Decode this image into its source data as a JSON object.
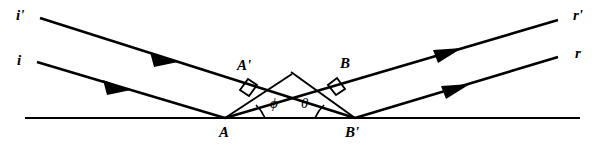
{
  "figure": {
    "background_color": "#ffffff",
    "stroke_color": "#000000"
  },
  "labels": {
    "incident_upper": "i'",
    "incident_lower": "i",
    "reflected_upper": "r'",
    "reflected_lower": "r",
    "point_a": "A",
    "point_a_prime": "A'",
    "point_b": "B",
    "point_b_prime": "B'",
    "angle_phi": "ϕ",
    "angle_theta": "θ"
  },
  "geometry": {
    "mirror": {
      "x1": 25,
      "y1": 118,
      "x2": 580,
      "y2": 118
    },
    "rays": [
      {
        "name": "incident-upper-ray",
        "from_label": "i'",
        "x1": 40,
        "y1": 18,
        "x2": 355,
        "y2": 118,
        "arrow_at": 0.42,
        "direction": "down-right"
      },
      {
        "name": "incident-lower-ray",
        "from_label": "i",
        "x1": 37,
        "y1": 62,
        "x2": 225,
        "y2": 118,
        "arrow_at": 0.47,
        "direction": "down-right"
      },
      {
        "name": "reflected-upper-ray",
        "to_label": "r'",
        "x1": 225,
        "y1": 118,
        "x2": 558,
        "y2": 20,
        "arrow_at": 0.7,
        "direction": "up-right"
      },
      {
        "name": "reflected-lower-ray",
        "to_label": "r",
        "x1": 355,
        "y1": 118,
        "x2": 558,
        "y2": 57,
        "arrow_at": 0.68,
        "direction": "up-right"
      }
    ],
    "wavefronts": [
      {
        "name": "wavefront-a-prime",
        "x1": 225,
        "y1": 118,
        "x2": 290,
        "y2": 75,
        "label": "A'"
      },
      {
        "name": "wavefront-b",
        "x1": 355,
        "y1": 118,
        "x2": 292,
        "y2": 73,
        "label": "B"
      }
    ],
    "perpendicular_marks": [
      {
        "name": "right-angle-a-prime",
        "x": 244,
        "y": 84
      },
      {
        "name": "right-angle-b",
        "x": 340,
        "y": 82
      }
    ],
    "angles": [
      {
        "name": "angle-phi",
        "vertex": "A",
        "vx": 225,
        "vy": 118,
        "label": "ϕ",
        "lx": 272,
        "ly": 99
      },
      {
        "name": "angle-theta",
        "vertex": "B'",
        "vx": 355,
        "vy": 118,
        "label": "θ",
        "lx": 303,
        "ly": 99
      }
    ],
    "label_positions": {
      "incident_upper": {
        "x": 18,
        "y": 10
      },
      "incident_lower": {
        "x": 18,
        "y": 55
      },
      "reflected_upper": {
        "x": 570,
        "y": 10
      },
      "reflected_lower": {
        "x": 570,
        "y": 48
      },
      "point_a": {
        "x": 219,
        "y": 124
      },
      "point_a_prime": {
        "x": 238,
        "y": 60
      },
      "point_b": {
        "x": 339,
        "y": 58
      },
      "point_b_prime": {
        "x": 346,
        "y": 124
      }
    }
  }
}
